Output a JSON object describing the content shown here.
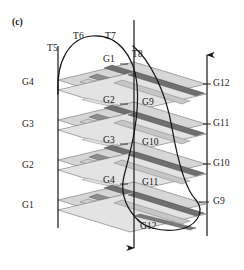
{
  "figure": {
    "panel_label": "(c)",
    "type": "3d-isometric-stacked-grating-diagram",
    "colors": {
      "line": "#161616",
      "plate_dark": "#6f6f6f",
      "plate_mid": "#8f8f8f",
      "plate_light": "#c9c9c9",
      "plate_pale": "#e0e0e0",
      "background": "#ffffff"
    },
    "layers_count": 4
  },
  "labels": {
    "top": [
      {
        "id": "t5",
        "text": "T5",
        "x": 47,
        "y": 44
      },
      {
        "id": "t6",
        "text": "T6",
        "x": 73,
        "y": 32
      },
      {
        "id": "t7",
        "text": "T7",
        "x": 105,
        "y": 32
      },
      {
        "id": "t8",
        "text": "T8",
        "x": 132,
        "y": 50
      }
    ],
    "left_column": [
      {
        "id": "g4-left",
        "text": "G4",
        "x": 22,
        "y": 78
      },
      {
        "id": "g3-left",
        "text": "G3",
        "x": 22,
        "y": 120
      },
      {
        "id": "g2-left",
        "text": "G2",
        "x": 22,
        "y": 161
      },
      {
        "id": "g1-left",
        "text": "G1",
        "x": 22,
        "y": 201
      }
    ],
    "right_column": [
      {
        "id": "g12-right",
        "text": "G12",
        "x": 213,
        "y": 81
      },
      {
        "id": "g11-right",
        "text": "G11",
        "x": 213,
        "y": 121
      },
      {
        "id": "g10-right",
        "text": "G10",
        "x": 213,
        "y": 161
      },
      {
        "id": "g9-right",
        "text": "G9",
        "x": 213,
        "y": 199
      }
    ],
    "center_left": [
      {
        "id": "g1-center",
        "text": "G1",
        "x": 103,
        "y": 58
      },
      {
        "id": "g2-center",
        "text": "G2",
        "x": 103,
        "y": 98
      },
      {
        "id": "g3-center",
        "text": "G3",
        "x": 103,
        "y": 138
      },
      {
        "id": "g4-center",
        "text": "G4",
        "x": 103,
        "y": 178
      }
    ],
    "center_right": [
      {
        "id": "g9-center",
        "text": "G9",
        "x": 143,
        "y": 101
      },
      {
        "id": "g10-center",
        "text": "G10",
        "x": 143,
        "y": 141
      },
      {
        "id": "g11-center",
        "text": "G11",
        "x": 143,
        "y": 181
      },
      {
        "id": "g12-center",
        "text": "G12",
        "x": 143,
        "y": 224
      }
    ]
  },
  "axes": [
    {
      "id": "left-axis",
      "x": 58,
      "y1": 46,
      "y2": 228,
      "arrow": "none"
    },
    {
      "id": "center-axis",
      "x": 134,
      "y1": 20,
      "y2": 258,
      "arrow": "down"
    },
    {
      "id": "right-axis",
      "x": 207,
      "y1": 46,
      "y2": 236,
      "arrow": "up"
    }
  ],
  "arcs": [
    {
      "id": "arc-left-helix",
      "from": "T5 / left axis top",
      "to": "bottom center"
    },
    {
      "id": "arc-right-helix",
      "from": "T8 / center top",
      "to": "G9 / bottom right"
    }
  ]
}
